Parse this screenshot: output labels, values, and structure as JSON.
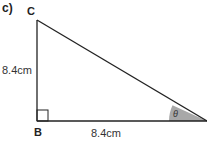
{
  "question_label": "c)",
  "vertices": {
    "top": "C",
    "bottom_left": "B"
  },
  "sides": {
    "vertical": "8.4cm",
    "horizontal": "8.4cm"
  },
  "angle_label": "θ",
  "colors": {
    "line": "#222222",
    "angle_fill": "#a8a8a8",
    "text": "#333333"
  }
}
